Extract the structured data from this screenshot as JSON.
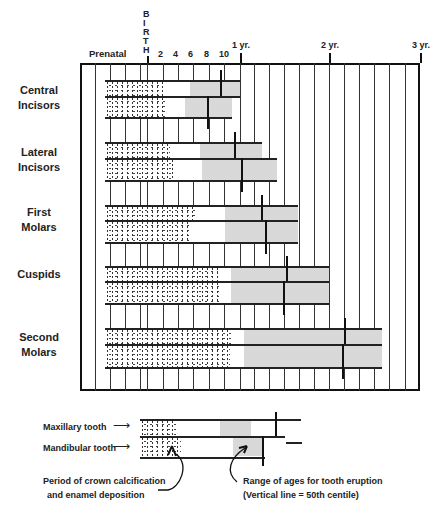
{
  "axis": {
    "prenatal_label": "Prenatal",
    "birth_letters": [
      "B",
      "I",
      "R",
      "T",
      "H"
    ],
    "month_ticks": [
      {
        "label": "2",
        "x": 163
      },
      {
        "label": "4",
        "x": 178
      },
      {
        "label": "6",
        "x": 193
      },
      {
        "label": "8",
        "x": 209
      },
      {
        "label": "10",
        "x": 224
      }
    ],
    "year_ticks": [
      {
        "label": "1 yr.",
        "x": 240
      },
      {
        "label": "2 yr.",
        "x": 329
      },
      {
        "label": "3 yr.",
        "x": 420
      }
    ]
  },
  "grid": {
    "left": 80,
    "right": 420,
    "top": 63,
    "bottom": 391,
    "columns": [
      95,
      110,
      125,
      140,
      147,
      163,
      178,
      193,
      209,
      224,
      240,
      254,
      269,
      284,
      299,
      314,
      329,
      344,
      359,
      374,
      389,
      405
    ]
  },
  "teeth": [
    {
      "name": "Central Incisors",
      "lines": [
        "Central",
        "Incisors"
      ],
      "label_y": 83,
      "top": 80,
      "mid": 96,
      "bottom": 117,
      "maxillary": {
        "end": 240,
        "calc_end": 163,
        "erupt_start": 190,
        "erupt_end": 240,
        "median": 220
      },
      "mandibular": {
        "end": 232,
        "calc_end": 167,
        "erupt_start": 185,
        "erupt_end": 232,
        "median": 207
      }
    },
    {
      "name": "Lateral Incisors",
      "lines": [
        "Lateral",
        "Incisors"
      ],
      "label_y": 145,
      "top": 142,
      "mid": 158,
      "bottom": 180,
      "maxillary": {
        "end": 262,
        "calc_end": 170,
        "erupt_start": 200,
        "erupt_end": 262,
        "median": 234
      },
      "mandibular": {
        "end": 277,
        "calc_end": 173,
        "erupt_start": 202,
        "erupt_end": 277,
        "median": 241
      }
    },
    {
      "name": "First Molars",
      "lines": [
        "First",
        "Molars"
      ],
      "label_y": 205,
      "top": 205,
      "mid": 220,
      "bottom": 242,
      "maxillary": {
        "end": 298,
        "calc_end": 197,
        "erupt_start": 225,
        "erupt_end": 298,
        "median": 261
      },
      "mandibular": {
        "end": 298,
        "calc_end": 190,
        "erupt_start": 225,
        "erupt_end": 298,
        "median": 265
      }
    },
    {
      "name": "Cuspids",
      "lines": [
        "Cuspids"
      ],
      "label_y": 267,
      "top": 266,
      "mid": 281,
      "bottom": 303,
      "maxillary": {
        "end": 329,
        "calc_end": 218,
        "erupt_start": 231,
        "erupt_end": 329,
        "median": 286
      },
      "mandibular": {
        "end": 329,
        "calc_end": 221,
        "erupt_start": 231,
        "erupt_end": 329,
        "median": 283
      }
    },
    {
      "name": "Second Molars",
      "lines": [
        "Second",
        "Molars"
      ],
      "label_y": 330,
      "top": 328,
      "mid": 344,
      "bottom": 367,
      "maxillary": {
        "end": 382,
        "calc_end": 231,
        "erupt_start": 244,
        "erupt_end": 382,
        "median": 344
      },
      "mandibular": {
        "end": 382,
        "calc_end": 230,
        "erupt_start": 244,
        "erupt_end": 382,
        "median": 342
      }
    }
  ],
  "legend": {
    "maxillary_label": "Maxillary tooth",
    "mandibular_label": "Mandibular tooth",
    "calcification_line1": "Period of crown calcification",
    "calcification_line2": "and enamel deposition",
    "eruption_line1": "Range of ages for tooth eruption",
    "eruption_line2": "(Vertical line  =  50th centile)"
  }
}
